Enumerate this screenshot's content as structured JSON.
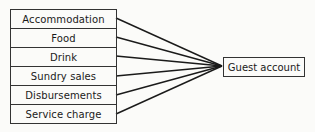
{
  "diagram": {
    "sources": [
      {
        "label": "Accommodation"
      },
      {
        "label": "Food"
      },
      {
        "label": "Drink"
      },
      {
        "label": "Sundry sales"
      },
      {
        "label": "Disbursements"
      },
      {
        "label": "Service charge"
      }
    ],
    "target": {
      "label": "Guest account"
    },
    "line_color": "#1a1a1a",
    "border_color": "#333333"
  }
}
